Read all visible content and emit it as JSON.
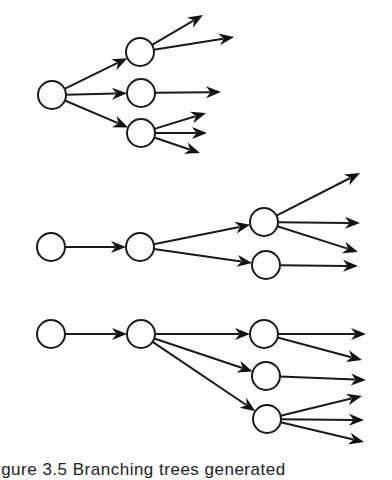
{
  "figure": {
    "caption": "Figure 3.5  Branching trees generated"
  },
  "colors": {
    "stroke": "#1a1a1a",
    "arrowhead": "#111111",
    "node_fill": "#ffffff",
    "background": "#ffffff"
  },
  "node_radius": 14,
  "trees": [
    {
      "name": "tree-top",
      "nodes": [
        {
          "id": "a",
          "x": 52,
          "y": 95
        },
        {
          "id": "b",
          "x": 140,
          "y": 52
        },
        {
          "id": "c",
          "x": 141,
          "y": 93
        },
        {
          "id": "d",
          "x": 141,
          "y": 133
        }
      ],
      "edges": [
        {
          "from": "a",
          "to": "b"
        },
        {
          "from": "a",
          "to": "c"
        },
        {
          "from": "a",
          "to": "d"
        }
      ],
      "leaf_arrows": [
        {
          "from": "b",
          "tip": [
            203,
            15
          ]
        },
        {
          "from": "b",
          "tip": [
            234,
            37
          ]
        },
        {
          "from": "c",
          "tip": [
            221,
            92
          ]
        },
        {
          "from": "d",
          "tip": [
            206,
            113
          ]
        },
        {
          "from": "d",
          "tip": [
            207,
            133
          ]
        },
        {
          "from": "d",
          "tip": [
            200,
            153
          ]
        }
      ]
    },
    {
      "name": "tree-middle",
      "nodes": [
        {
          "id": "a",
          "x": 51,
          "y": 247
        },
        {
          "id": "b",
          "x": 140,
          "y": 247
        },
        {
          "id": "c",
          "x": 264,
          "y": 222
        },
        {
          "id": "d",
          "x": 266,
          "y": 265
        }
      ],
      "edges": [
        {
          "from": "a",
          "to": "b"
        },
        {
          "from": "b",
          "to": "c"
        },
        {
          "from": "b",
          "to": "d"
        }
      ],
      "leaf_arrows": [
        {
          "from": "c",
          "tip": [
            360,
            173
          ]
        },
        {
          "from": "c",
          "tip": [
            360,
            223
          ]
        },
        {
          "from": "c",
          "tip": [
            358,
            252
          ]
        },
        {
          "from": "d",
          "tip": [
            358,
            266
          ]
        }
      ]
    },
    {
      "name": "tree-bottom",
      "nodes": [
        {
          "id": "a",
          "x": 51,
          "y": 334
        },
        {
          "id": "b",
          "x": 141,
          "y": 334
        },
        {
          "id": "c",
          "x": 264,
          "y": 334
        },
        {
          "id": "d",
          "x": 266,
          "y": 376
        },
        {
          "id": "e",
          "x": 267,
          "y": 419
        }
      ],
      "edges": [
        {
          "from": "a",
          "to": "b"
        },
        {
          "from": "b",
          "to": "c"
        },
        {
          "from": "b",
          "to": "d"
        },
        {
          "from": "b",
          "to": "e"
        }
      ],
      "leaf_arrows": [
        {
          "from": "c",
          "tip": [
            366,
            334
          ]
        },
        {
          "from": "c",
          "tip": [
            362,
            360
          ]
        },
        {
          "from": "d",
          "tip": [
            366,
            380
          ]
        },
        {
          "from": "e",
          "tip": [
            362,
            396
          ]
        },
        {
          "from": "e",
          "tip": [
            364,
            420
          ]
        },
        {
          "from": "e",
          "tip": [
            364,
            442
          ]
        }
      ]
    }
  ]
}
